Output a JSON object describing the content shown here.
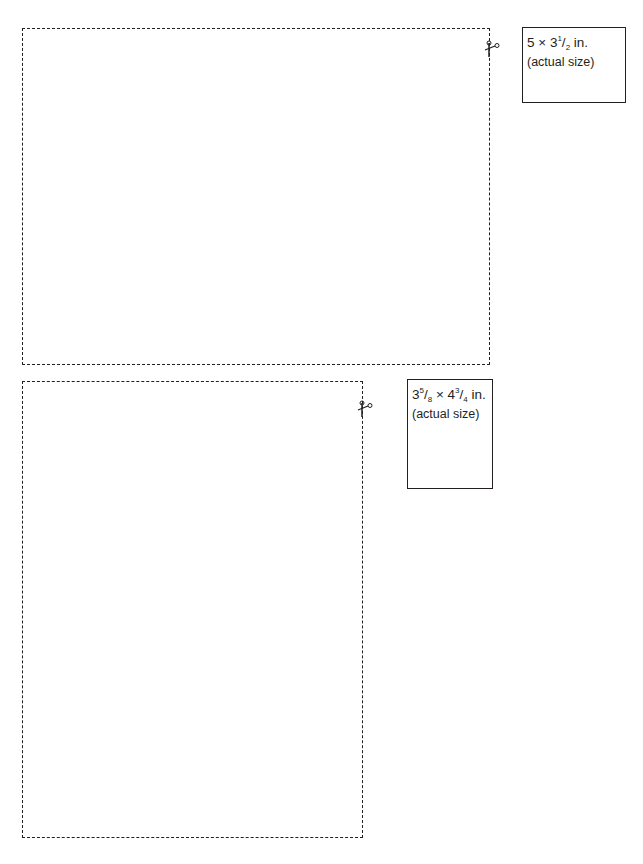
{
  "templates": [
    {
      "id": "template-1",
      "label": {
        "whole": "5 × 3",
        "frac_num": "1",
        "frac_den": "2",
        "unit": " in.",
        "note": "(actual size)"
      },
      "orientation": "landscape"
    },
    {
      "id": "template-2",
      "label": {
        "whole1": "3",
        "frac1_num": "5",
        "frac1_den": "8",
        "sep": " × 4",
        "frac2_num": "3",
        "frac2_den": "4",
        "unit": " in.",
        "note": "(actual size)"
      },
      "orientation": "portrait"
    }
  ],
  "icons": {
    "cut": "scissors-icon"
  },
  "colors": {
    "ink": "#231f20",
    "background": "#ffffff"
  }
}
